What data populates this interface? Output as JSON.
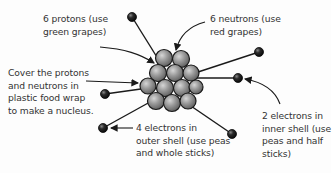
{
  "diagram": {
    "labels": {
      "protons": "6 protons (use\ngreen grapes)",
      "neutrons": "6 neutrons (use\nred grapes)",
      "cover": "Cover the protons\nand neutrons in\nplastic food wrap\nto make a nucleus.",
      "outer_electrons": "4 electrons in\nouter shell (use peas\nand whole sticks)",
      "inner_electrons": "2 electrons in\ninner shell (use\npeas and half\nsticks)"
    },
    "nodes": {
      "nucleus": {
        "type": "cluster",
        "count": 12,
        "color": "#8a8a8a"
      },
      "electrons": [
        {
          "shell": "outer",
          "x": 132,
          "y": 17
        },
        {
          "shell": "outer",
          "x": 259,
          "y": 52
        },
        {
          "shell": "inner",
          "x": 238,
          "y": 78
        },
        {
          "shell": "inner",
          "x": 105,
          "y": 94
        },
        {
          "shell": "outer",
          "x": 103,
          "y": 128
        },
        {
          "shell": "outer",
          "x": 232,
          "y": 134
        }
      ]
    },
    "colors": {
      "sphere": "#8a8a8a",
      "electron": "#1e1e1e",
      "stroke": "#1a1a1a",
      "text": "#333333"
    }
  }
}
